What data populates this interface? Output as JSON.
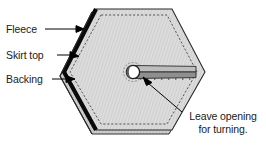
{
  "figure": {
    "shape": "hexagon",
    "colors": {
      "fleece_edge": "#0a0a0a",
      "skirt_fill": "#d9d9d9",
      "backing_fill": "#c9c9c9",
      "stitch_line": "#555555",
      "outline": "#222222",
      "text": "#1a1a1a",
      "leader": "#000000"
    }
  },
  "labels": {
    "fleece": "Fleece",
    "skirt_top": "Skirt top",
    "backing": "Backing",
    "leave_opening_line1": "Leave opening",
    "leave_opening_line2": "for turning."
  },
  "callouts": [
    {
      "name": "fleece",
      "text": "Fleece",
      "points_to": "upper-left dark fleece edge"
    },
    {
      "name": "skirt-top",
      "text": "Skirt top",
      "points_to": "left vertex skirt layer"
    },
    {
      "name": "backing",
      "text": "Backing",
      "points_to": "lower-left backing layer"
    },
    {
      "name": "leave-opening",
      "text": "Leave opening for turning.",
      "points_to": "center channel opening"
    }
  ],
  "details": {
    "center_hole": "circular opening at hexagon center",
    "channel": "narrow slit extending right from center hole",
    "stitching": "dashed stitch line inset from hexagon edge"
  }
}
